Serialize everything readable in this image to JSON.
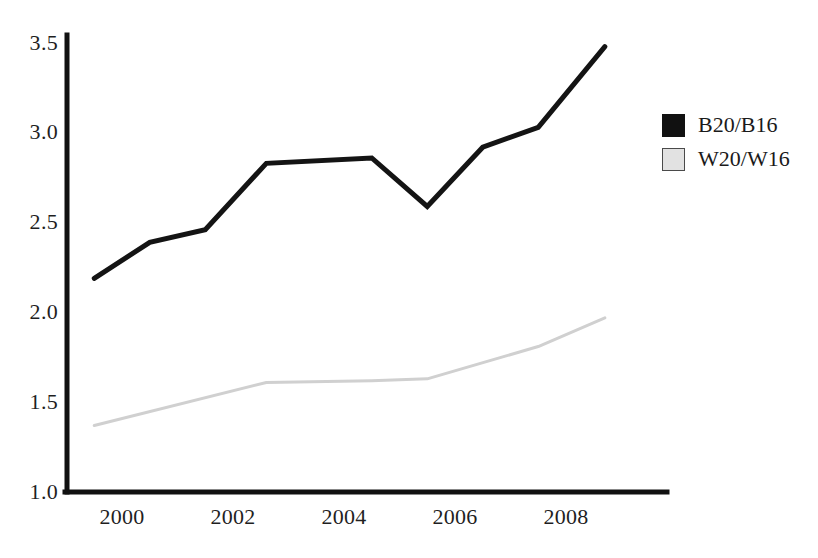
{
  "chart_data": {
    "type": "line",
    "title": "",
    "xlabel": "",
    "ylabel": "",
    "xlim": [
      1999.0,
      2009.0
    ],
    "ylim": [
      1.0,
      3.5
    ],
    "grid": false,
    "legend_position": "right",
    "x_ticks": [
      "2000",
      "2002",
      "2004",
      "2006",
      "2008"
    ],
    "x_tick_values": [
      2000,
      2002,
      2004,
      2006,
      2008
    ],
    "y_ticks": [
      "1.0",
      "1.5",
      "2.0",
      "2.5",
      "3.0",
      "3.5"
    ],
    "y_tick_values": [
      1.0,
      1.5,
      2.0,
      2.5,
      3.0,
      3.5
    ],
    "series": [
      {
        "name": "B20/B16",
        "color": "#141414",
        "x": [
          1999.5,
          2000.5,
          2001.5,
          2002.6,
          2004.5,
          2005.5,
          2006.5,
          2007.5,
          2008.7
        ],
        "values": [
          2.19,
          2.39,
          2.46,
          2.83,
          2.86,
          2.59,
          2.92,
          3.03,
          3.48
        ]
      },
      {
        "name": "W20/W16",
        "color": "#d0d0d0",
        "x": [
          1999.5,
          2002.6,
          2004.5,
          2005.5,
          2007.5,
          2008.7
        ],
        "values": [
          1.37,
          1.61,
          1.62,
          1.63,
          1.81,
          1.97
        ]
      }
    ]
  },
  "axes": {
    "y_labels": [
      "3.5",
      "3.0",
      "2.5",
      "2.0",
      "1.5",
      "1.0"
    ],
    "x_labels": [
      "2000",
      "2002",
      "2004",
      "2006",
      "2008"
    ]
  },
  "legend": {
    "items": [
      {
        "label": "B20/B16",
        "swatch": "solid-black-swatch"
      },
      {
        "label": "W20/W16",
        "swatch": "light-gray-swatch"
      }
    ]
  }
}
